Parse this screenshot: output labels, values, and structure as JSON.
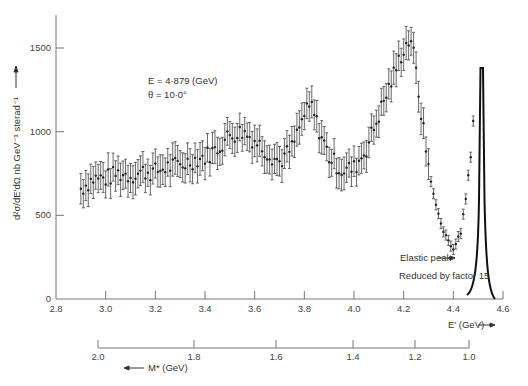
{
  "chart_data": {
    "type": "scatter",
    "title": "",
    "xlabel": "E' (GeV)",
    "ylabel": "d²σ/dE'dΩ nb GeV⁻¹ sterad⁻¹",
    "secondary_xlabel": "M* (GeV)",
    "xlim": [
      2.8,
      4.6
    ],
    "ylim": [
      0,
      1600
    ],
    "x_ticks": [
      "2.8",
      "3.0",
      "3.2",
      "3.4",
      "3.6",
      "3.8",
      "4.0",
      "4.2",
      "4.4",
      "4.6"
    ],
    "y_ticks": [
      "0",
      "500",
      "1000",
      "1500"
    ],
    "secondary_x_ticks": [
      "2.0",
      "1.8",
      "1.6",
      "1.4",
      "1.2",
      "1.0"
    ],
    "grid": false,
    "annotations": {
      "beam_energy": "E = 4·879 (GeV)",
      "angle": "θ = 10·0°",
      "elastic_label": "Elastic peak",
      "reduction_label": "Reduced by factor 15"
    },
    "series": [
      {
        "name": "Inelastic data",
        "style": "points with error bars",
        "x": [
          2.9,
          2.95,
          3.0,
          3.05,
          3.1,
          3.15,
          3.2,
          3.25,
          3.3,
          3.35,
          3.4,
          3.45,
          3.5,
          3.55,
          3.6,
          3.65,
          3.7,
          3.75,
          3.8,
          3.83,
          3.85,
          3.9,
          3.95,
          4.0,
          4.05,
          4.1,
          4.15,
          4.2,
          4.23,
          4.25,
          4.28,
          4.3,
          4.33,
          4.36,
          4.4,
          4.43,
          4.45,
          4.47,
          4.48
        ],
        "y": [
          660,
          720,
          720,
          750,
          740,
          760,
          760,
          790,
          800,
          830,
          850,
          900,
          980,
          1000,
          950,
          880,
          820,
          900,
          1100,
          1150,
          1050,
          850,
          770,
          780,
          900,
          1100,
          1300,
          1500,
          1560,
          1350,
          1000,
          800,
          550,
          400,
          310,
          380,
          600,
          850,
          1080
        ],
        "error": 80
      },
      {
        "name": "Elastic peak (reduced by factor 15)",
        "style": "line",
        "x": [
          4.46,
          4.48,
          4.49,
          4.5,
          4.505,
          4.51,
          4.52,
          4.54
        ],
        "y": [
          40,
          200,
          600,
          1380,
          1380,
          600,
          150,
          10
        ]
      }
    ]
  }
}
